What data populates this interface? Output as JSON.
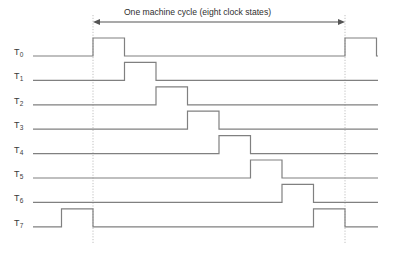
{
  "diagram": {
    "type": "timing-diagram",
    "caption": "One machine cycle (eight clock states)",
    "background_color": "#ffffff",
    "waveform_color": "#808080",
    "guide_color": "#b0b0b0",
    "arrow_color": "#555555",
    "text_color": "#2e2e2e",
    "geometry": {
      "width": 395,
      "height": 254,
      "label_x": 17,
      "track_start_x": 33,
      "track_end_x": 378,
      "cycle_start_x": 93,
      "cycle_end_x": 345,
      "state_width": 31.5,
      "baseline_start_y": 56,
      "row_pitch": 24.4,
      "pulse_height": 18,
      "arrow_y": 22,
      "guide_top_y": 15,
      "guide_bottom_y": 243
    },
    "rows": [
      {
        "label": "T",
        "subscript": "0",
        "name": "t0",
        "baseline_y": 56,
        "pulses": [
          {
            "start_state": 0,
            "end_state": 1
          },
          {
            "start_state": 8,
            "end_state": 9
          }
        ]
      },
      {
        "label": "T",
        "subscript": "1",
        "name": "t1",
        "baseline_y": 80.4,
        "pulses": [
          {
            "start_state": 1,
            "end_state": 2
          }
        ]
      },
      {
        "label": "T",
        "subscript": "2",
        "name": "t2",
        "baseline_y": 104.8,
        "pulses": [
          {
            "start_state": 2,
            "end_state": 3
          }
        ]
      },
      {
        "label": "T",
        "subscript": "3",
        "name": "t3",
        "baseline_y": 129.2,
        "pulses": [
          {
            "start_state": 3,
            "end_state": 4
          }
        ]
      },
      {
        "label": "T",
        "subscript": "4",
        "name": "t4",
        "baseline_y": 153.6,
        "pulses": [
          {
            "start_state": 4,
            "end_state": 5
          }
        ]
      },
      {
        "label": "T",
        "subscript": "5",
        "name": "t5",
        "baseline_y": 178.0,
        "pulses": [
          {
            "start_state": 5,
            "end_state": 6
          }
        ]
      },
      {
        "label": "T",
        "subscript": "6",
        "name": "t6",
        "baseline_y": 202.4,
        "pulses": [
          {
            "start_state": 6,
            "end_state": 7
          }
        ]
      },
      {
        "label": "T",
        "subscript": "7",
        "name": "t7",
        "baseline_y": 226.8,
        "pulses": [
          {
            "start_state": -1,
            "end_state": 0
          },
          {
            "start_state": 7,
            "end_state": 8
          }
        ]
      }
    ],
    "guides": [
      {
        "name": "cycle-start-guide",
        "x": 93
      },
      {
        "name": "cycle-end-guide",
        "x": 345
      }
    ]
  }
}
